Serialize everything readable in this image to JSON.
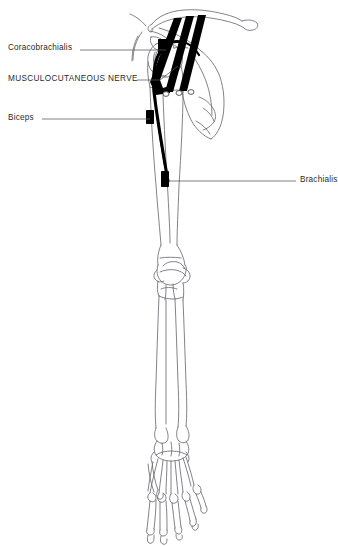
{
  "figure": {
    "background_color": "#ffffff",
    "bone_outline_color": "#6b6b72",
    "nerve_color": "#000000",
    "leader_color": "#555555",
    "marker_color": "#000000"
  },
  "labels": {
    "coracobrachialis": "Coracobrachialis",
    "musculocutaneous_nerve": "MUSCULOCUTANEOUS NERVE",
    "biceps": "Biceps",
    "brachialis": "Brachialis"
  },
  "annotations": [
    {
      "name": "coracobrachialis",
      "text": "Coracobrachialis",
      "side": "left",
      "leader_from_x": 80,
      "leader_to_x": 166,
      "leader_y": 50,
      "marker_x": 163,
      "marker_y": 43
    },
    {
      "name": "musculocutaneous-nerve",
      "text": "MUSCULOCUTANEOUS NERVE",
      "side": "left",
      "leader_from_x": 137,
      "leader_to_x": 176,
      "leader_y": 80
    },
    {
      "name": "biceps",
      "text": "Biceps",
      "side": "left",
      "leader_from_x": 42,
      "leader_to_x": 152,
      "leader_y": 119,
      "marker_x": 149,
      "marker_y": 113
    },
    {
      "name": "brachialis",
      "text": "Brachialis",
      "side": "right",
      "leader_from_x": 171,
      "leader_to_x": 296,
      "leader_y": 181,
      "marker_x": 165,
      "marker_y": 174
    }
  ],
  "anatomy": {
    "bones": [
      "clavicle",
      "scapula",
      "humerus",
      "radius",
      "ulna",
      "carpals",
      "metacarpals",
      "phalanges"
    ],
    "nerve_roots_count": 3,
    "nerve_name": "musculocutaneous nerve",
    "muscle_attachment_markers": [
      "coracobrachialis",
      "biceps",
      "brachialis"
    ]
  }
}
